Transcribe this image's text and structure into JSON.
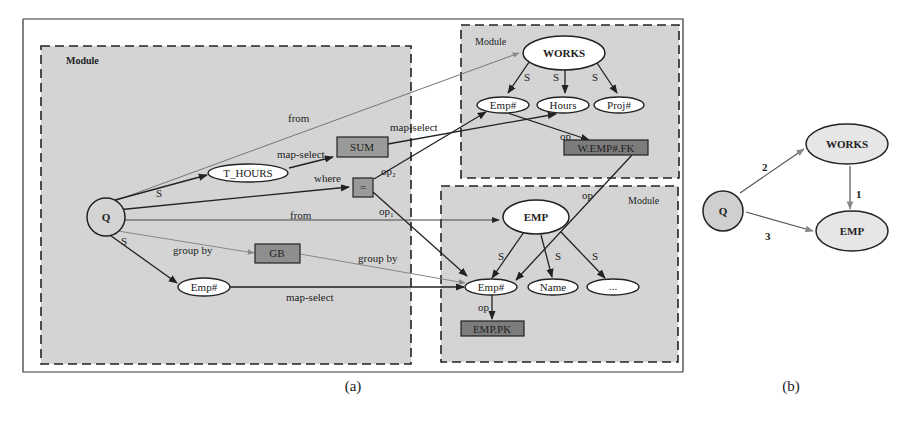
{
  "figure": {
    "captions": {
      "a": "(a)",
      "b": "(b)"
    },
    "colors": {
      "module_fill": "#d4d4d4",
      "node_fill": "#ffffff",
      "box_fill": "#9a9a9a",
      "box_dark_fill": "#7c7c7c",
      "stroke": "#222222",
      "gray_edge": "#888888",
      "b_node_fill": "#d8d8d8"
    }
  },
  "panel_a": {
    "modules": {
      "query": {
        "label": "Module"
      },
      "works": {
        "label": "Module"
      },
      "emp": {
        "label": "Module"
      }
    },
    "nodes": {
      "Q": "Q",
      "t_hours": "T_HOURS",
      "sum": "SUM",
      "eq": "=",
      "gb": "GB",
      "q_emp": "Emp#",
      "works": "WORKS",
      "works_emp": "Emp#",
      "works_hours": "Hours",
      "works_proj": "Proj#",
      "works_fk": "W.EMP#.FK",
      "emp": "EMP",
      "emp_emp": "Emp#",
      "emp_name": "Name",
      "emp_more": "...",
      "emp_pk": "EMP.PK"
    },
    "edge_labels": {
      "from_works": "from",
      "s_thours": "S",
      "map_select_sum": "map-select",
      "map_select_hours": "map-select",
      "where": "where",
      "op_eq_works": "op₂",
      "op_eq_emp": "op₁",
      "from_emp": "from",
      "group_by_gb": "group by",
      "group_by_emp": "group by",
      "s_qemp": "S",
      "map_select_emp": "map-select",
      "works_s1": "S",
      "works_s2": "S",
      "works_s3": "S",
      "op_fk": "op",
      "op_fk_emp": "op",
      "emp_s1": "S",
      "emp_s2": "S",
      "emp_s3": "S",
      "op_pk": "op"
    }
  },
  "panel_b": {
    "nodes": {
      "Q": "Q",
      "works": "WORKS",
      "emp": "EMP"
    },
    "edges": [
      {
        "from": "WORKS",
        "to": "EMP",
        "label": "1"
      },
      {
        "from": "Q",
        "to": "WORKS",
        "label": "2"
      },
      {
        "from": "Q",
        "to": "EMP",
        "label": "3"
      }
    ]
  }
}
